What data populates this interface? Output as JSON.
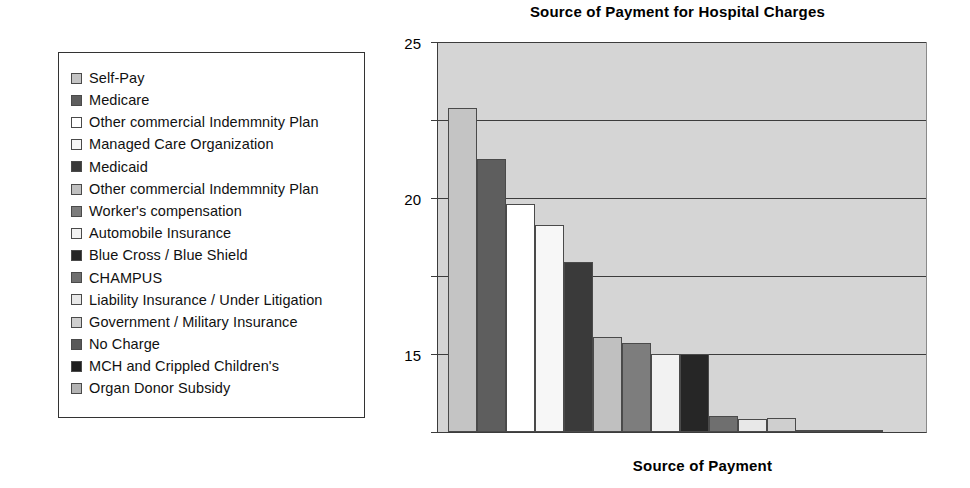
{
  "chart_data": {
    "type": "bar",
    "title": "Source of Payment for Hospital Charges",
    "xlabel": "Source of Payment",
    "ylabel": "Percentage of Patients",
    "ylim": [
      0,
      25
    ],
    "yticks": [
      "0",
      "5",
      "10",
      "15",
      "20",
      "25"
    ],
    "ytick_values": [
      0,
      5,
      10,
      15,
      20,
      25
    ],
    "grid": "horizontal",
    "legend_position": "left-external",
    "plot_background": "#d5d5d5",
    "categories": [
      "Self-Pay",
      "Medicare",
      "Other commercial Indemmnity Plan",
      "Managed Care Organization",
      "Medicaid",
      "Other commercial Indemmnity Plan",
      "Worker's compensation",
      "Automobile Insurance",
      "Blue Cross / Blue Shield",
      "CHAMPUS",
      "Liability Insurance / Under Litigation",
      "Government / Military Insurance",
      "No Charge",
      "MCH and Crippled Children's",
      "Organ Donor Subsidy"
    ],
    "values": [
      20.8,
      17.5,
      14.6,
      13.3,
      10.9,
      6.1,
      5.7,
      5.0,
      5.0,
      1.0,
      0.85,
      0.9,
      0.1,
      0.0,
      0.0
    ],
    "colors": [
      "#c4c4c4",
      "#5e5e5e",
      "#ffffff",
      "#f7f7f7",
      "#3a3a3a",
      "#c0c0c0",
      "#7d7d7d",
      "#f2f2f2",
      "#262626",
      "#6f6f6f",
      "#e8e8e8",
      "#cfcfcf",
      "#585858",
      "#1e1e1e",
      "#b3b3b3"
    ]
  },
  "legend": {
    "items": [
      {
        "label": "Self-Pay",
        "color": "#c4c4c4"
      },
      {
        "label": "Medicare",
        "color": "#5e5e5e"
      },
      {
        "label": "Other commercial Indemmnity Plan",
        "color": "#ffffff"
      },
      {
        "label": "Managed Care Organization",
        "color": "#f7f7f7"
      },
      {
        "label": "Medicaid",
        "color": "#3a3a3a"
      },
      {
        "label": "Other commercial Indemmnity Plan",
        "color": "#c0c0c0"
      },
      {
        "label": "Worker's compensation",
        "color": "#7d7d7d"
      },
      {
        "label": "Automobile Insurance",
        "color": "#f2f2f2"
      },
      {
        "label": "Blue Cross / Blue Shield",
        "color": "#262626"
      },
      {
        "label": "CHAMPUS",
        "color": "#6f6f6f"
      },
      {
        "label": "Liability Insurance / Under Litigation",
        "color": "#e8e8e8"
      },
      {
        "label": "Government / Military Insurance",
        "color": "#cfcfcf"
      },
      {
        "label": "No Charge",
        "color": "#585858"
      },
      {
        "label": "MCH and Crippled Children's",
        "color": "#1e1e1e"
      },
      {
        "label": "Organ Donor Subsidy",
        "color": "#b3b3b3"
      }
    ]
  }
}
